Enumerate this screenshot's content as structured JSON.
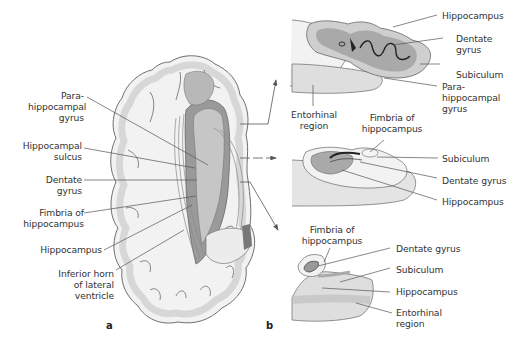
{
  "figure": {
    "panel_a": {
      "letter": "a",
      "labels": [
        {
          "id": "parahippocampal-gyrus",
          "text": "Para-\nhippocampal\ngyrus"
        },
        {
          "id": "hippocampal-sulcus",
          "text": "Hippocampal\nsulcus"
        },
        {
          "id": "dentate-gyrus",
          "text": "Dentate\ngyrus"
        },
        {
          "id": "fimbria-of-hippocampus",
          "text": "Fimbria of\nhippocampus"
        },
        {
          "id": "hippocampus",
          "text": "Hippocampus"
        },
        {
          "id": "inferior-horn",
          "text": "Inferior horn\nof lateral\nventricle"
        }
      ]
    },
    "panel_b": {
      "letter": "b",
      "sections": [
        {
          "id": "top-section",
          "labels": [
            {
              "id": "hippocampus",
              "text": "Hippocampus"
            },
            {
              "id": "dentate-gyrus",
              "text": "Dentate\ngyrus"
            },
            {
              "id": "subiculum",
              "text": "Subiculum"
            },
            {
              "id": "parahippocampal-gyrus",
              "text": "Para-\nhippocampal\ngyrus"
            },
            {
              "id": "entorhinal-region",
              "text": "Entorhinal\nregion"
            }
          ]
        },
        {
          "id": "middle-section",
          "labels": [
            {
              "id": "fimbria-of-hippocampus",
              "text": "Fimbria of\nhippocampus"
            },
            {
              "id": "subiculum",
              "text": "Subiculum"
            },
            {
              "id": "dentate-gyrus",
              "text": "Dentate gyrus"
            },
            {
              "id": "hippocampus",
              "text": "Hippocampus"
            }
          ]
        },
        {
          "id": "bottom-section",
          "labels": [
            {
              "id": "fimbria-of-hippocampus",
              "text": "Fimbria of\nhippocampus"
            },
            {
              "id": "dentate-gyrus",
              "text": "Dentate gyrus"
            },
            {
              "id": "subiculum",
              "text": "Subiculum"
            },
            {
              "id": "hippocampus",
              "text": "Hippocampus"
            },
            {
              "id": "entorhinal-region",
              "text": "Entorhinal\nregion"
            }
          ]
        }
      ]
    },
    "colors": {
      "outline": "#6f6f6f",
      "white_matter": "#f4f4f4",
      "gray_matter": "#d9d9d9",
      "dark_tissue": "#8c8c8c",
      "mid_tissue": "#b3b3b3",
      "leader_line": "#555555"
    }
  }
}
